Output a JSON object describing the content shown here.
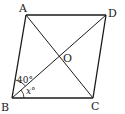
{
  "diagram": {
    "type": "parallelogram-with-diagonals",
    "vertices": {
      "A": {
        "label": "A",
        "x": 26,
        "y": 15
      },
      "B": {
        "label": "B",
        "x": 12,
        "y": 98
      },
      "C": {
        "label": "C",
        "x": 93,
        "y": 98
      },
      "D": {
        "label": "D",
        "x": 106,
        "y": 15
      }
    },
    "intersection": {
      "label": "O"
    },
    "edges": [
      "AB",
      "BC",
      "CD",
      "DA"
    ],
    "diagonals": [
      "AC",
      "BD"
    ],
    "angles": [
      {
        "name": "angle-ABD",
        "label": "40°",
        "value": "40°"
      },
      {
        "name": "angle-DBC",
        "label": "x°",
        "variable": "x",
        "unit": "°"
      }
    ]
  }
}
